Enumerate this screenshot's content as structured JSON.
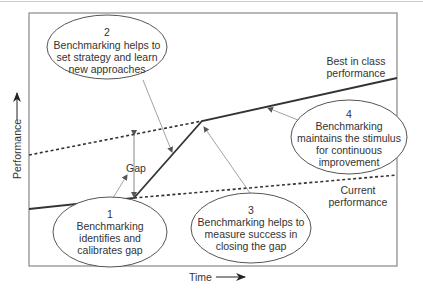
{
  "diagram": {
    "axes": {
      "y_label": "Performance",
      "x_label": "Time"
    },
    "lines": {
      "best_in_class": "Best in class performance",
      "current": "Current performance",
      "best_label_lines": [
        "Best in class",
        "performance"
      ],
      "current_label_lines": [
        "Current",
        "performance"
      ]
    },
    "gap_label": "Gap",
    "callouts": [
      {
        "number": "1",
        "lines": [
          "Benchmarking",
          "identifies and",
          "calibrates gap"
        ]
      },
      {
        "number": "2",
        "lines": [
          "Benchmarking helps to",
          "set strategy and learn",
          "new approaches"
        ]
      },
      {
        "number": "3",
        "lines": [
          "Benchmarking helps to",
          "measure success in",
          "closing the gap"
        ]
      },
      {
        "number": "4",
        "lines": [
          "Benchmarking",
          "maintains the stimulus",
          "for continuous",
          "improvement"
        ]
      }
    ],
    "colors": {
      "line": "#333333",
      "frame": "#888888",
      "pointer": "#999999",
      "text": "#333333"
    }
  }
}
